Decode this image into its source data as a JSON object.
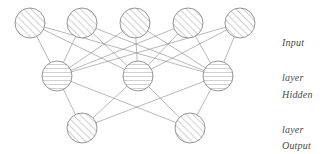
{
  "diagram": {
    "background_color": "#ffffff",
    "stroke_color": "#8a8a8a",
    "node_stroke_color": "#7a7a7a",
    "hatch_color": "#9a9a9a",
    "label_color": "#4a4a4a",
    "width": 329,
    "height": 154
  },
  "labels": [
    {
      "name": "input-layer-label",
      "line1": "Input",
      "line2": "layer",
      "x": 282,
      "y": 14
    },
    {
      "name": "hidden-layer-label",
      "line1": "Hidden",
      "line2": "layer",
      "x": 282,
      "y": 66
    },
    {
      "name": "output-layer-label",
      "line1": "Output",
      "line2": "layer",
      "x": 282,
      "y": 117
    }
  ],
  "layers": [
    {
      "id": "input",
      "label": "Input layer",
      "hatch": "diagonal",
      "radius": 15,
      "y": 23,
      "nodes": [
        {
          "id": "i1",
          "x": 30,
          "y": 23
        },
        {
          "id": "i2",
          "x": 82,
          "y": 23
        },
        {
          "id": "i3",
          "x": 135,
          "y": 23
        },
        {
          "id": "i4",
          "x": 188,
          "y": 23
        },
        {
          "id": "i5",
          "x": 240,
          "y": 23
        }
      ]
    },
    {
      "id": "hidden",
      "label": "Hidden layer",
      "hatch": "horizontal",
      "radius": 15,
      "y": 76,
      "nodes": [
        {
          "id": "h1",
          "x": 57,
          "y": 76
        },
        {
          "id": "h2",
          "x": 138,
          "y": 76
        },
        {
          "id": "h3",
          "x": 218,
          "y": 76
        }
      ]
    },
    {
      "id": "output",
      "label": "Output layer",
      "hatch": "diagonal",
      "radius": 15,
      "y": 128,
      "nodes": [
        {
          "id": "o1",
          "x": 82,
          "y": 128
        },
        {
          "id": "o2",
          "x": 190,
          "y": 128
        }
      ]
    }
  ],
  "edges": [
    {
      "from": "i1",
      "to": "h1"
    },
    {
      "from": "i1",
      "to": "h2"
    },
    {
      "from": "i1",
      "to": "h3"
    },
    {
      "from": "i2",
      "to": "h1"
    },
    {
      "from": "i2",
      "to": "h2"
    },
    {
      "from": "i2",
      "to": "h3"
    },
    {
      "from": "i3",
      "to": "h1"
    },
    {
      "from": "i3",
      "to": "h2"
    },
    {
      "from": "i3",
      "to": "h3"
    },
    {
      "from": "i4",
      "to": "h1"
    },
    {
      "from": "i4",
      "to": "h2"
    },
    {
      "from": "i4",
      "to": "h3"
    },
    {
      "from": "i5",
      "to": "h1"
    },
    {
      "from": "i5",
      "to": "h2"
    },
    {
      "from": "i5",
      "to": "h3"
    },
    {
      "from": "h1",
      "to": "o1"
    },
    {
      "from": "h1",
      "to": "o2"
    },
    {
      "from": "h2",
      "to": "o1"
    },
    {
      "from": "h2",
      "to": "o2"
    },
    {
      "from": "h3",
      "to": "o1"
    },
    {
      "from": "h3",
      "to": "o2"
    }
  ]
}
